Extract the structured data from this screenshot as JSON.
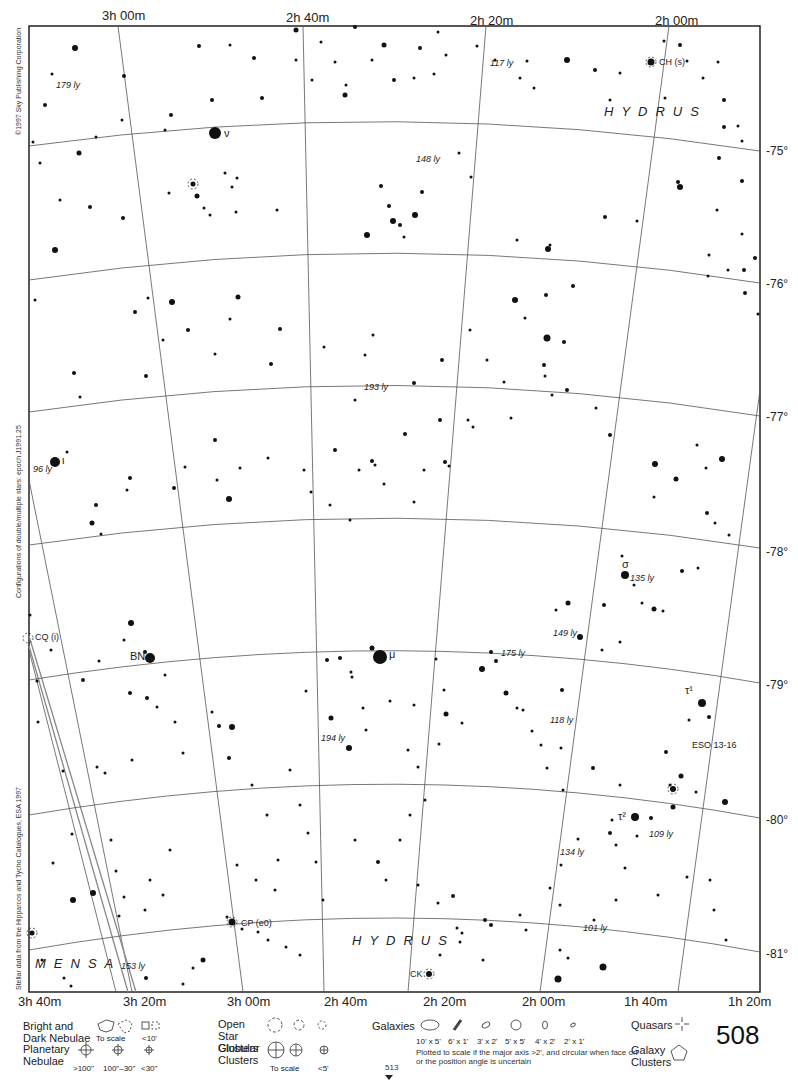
{
  "chart": {
    "constellations": [
      "HYDRUS",
      "MENSA"
    ],
    "ra_labels_top": [
      "3h 00m",
      "2h 40m",
      "2h 20m",
      "2h 00m"
    ],
    "ra_labels_bottom": [
      "3h 40m",
      "3h 20m",
      "3h 00m",
      "2h 40m",
      "2h 20m",
      "2h 00m",
      "1h 40m",
      "1h 20m"
    ],
    "dec_labels": [
      "-75°",
      "-76°",
      "-77°",
      "-78°",
      "-79°",
      "-80°",
      "-81°"
    ],
    "star_labels": [
      {
        "text": "ν",
        "x": 224,
        "y": 137
      },
      {
        "text": "ι",
        "x": 62,
        "y": 464
      },
      {
        "text": "μ",
        "x": 389,
        "y": 658
      },
      {
        "text": "σ",
        "x": 622,
        "y": 568
      },
      {
        "text": "τ¹",
        "x": 685,
        "y": 694
      },
      {
        "text": "τ²",
        "x": 618,
        "y": 820
      },
      {
        "text": "BN",
        "x": 130,
        "y": 660
      }
    ],
    "distance_labels": [
      {
        "text": "179 ly",
        "x": 56,
        "y": 88
      },
      {
        "text": "117 ly",
        "x": 490,
        "y": 66
      },
      {
        "text": "148 ly",
        "x": 416,
        "y": 162
      },
      {
        "text": "193 ly",
        "x": 364,
        "y": 390
      },
      {
        "text": "96 ly",
        "x": 33,
        "y": 472
      },
      {
        "text": "135 ly",
        "x": 630,
        "y": 581
      },
      {
        "text": "149 ly",
        "x": 553,
        "y": 636
      },
      {
        "text": "175 ly",
        "x": 501,
        "y": 656
      },
      {
        "text": "118 ly",
        "x": 550,
        "y": 723
      },
      {
        "text": "194 ly",
        "x": 321,
        "y": 741
      },
      {
        "text": "109 ly",
        "x": 649,
        "y": 837
      },
      {
        "text": "134 ly",
        "x": 560,
        "y": 855
      },
      {
        "text": "101 ly",
        "x": 583,
        "y": 931
      },
      {
        "text": "153 ly",
        "x": 121,
        "y": 969
      }
    ],
    "object_labels": [
      {
        "text": "CH (s)",
        "x": 659,
        "y": 65
      },
      {
        "text": "CQ (i)",
        "x": 35,
        "y": 640
      },
      {
        "text": "CP (e0)",
        "x": 241,
        "y": 926
      },
      {
        "text": "CK",
        "x": 410,
        "y": 977
      },
      {
        "text": "ESO 13-16",
        "x": 692,
        "y": 748
      }
    ],
    "side_texts": {
      "copyright": "©1997 Sky Publishing Corporation",
      "epoch": "Configurations of double/multiple stars: epoch J1991.25",
      "source": "Stellar data from the Hipparcos and Tycho Catalogues, ESA 1997"
    }
  },
  "legend": {
    "bright_dark_nebulae": "Bright and Dark Nebulae",
    "nebulae_to_scale": "To scale",
    "nebulae_small": "<10'",
    "planetary_nebulae": "Planetary Nebulae",
    "planetary_sizes": [
      ">100\"",
      "100\"–30\"",
      "<30\""
    ],
    "open_star_clusters": "Open Star Clusters",
    "globular_clusters": "Globular Clusters",
    "globular_to_scale": "To scale",
    "globular_small": "<5'",
    "galaxies": "Galaxies",
    "galaxy_sizes": [
      "10' x 5'",
      "6' x 1'",
      "3' x 2'",
      "5' x 5'",
      "4' x 2'",
      "2' x 1'"
    ],
    "galaxy_note": "Plotted to scale if the major axis >2', and circular when face on or the position angle is uncertain",
    "quasars": "Quasars",
    "galaxy_clusters": "Galaxy Clusters"
  },
  "page": {
    "number": "508",
    "next_page_ref": "513"
  }
}
